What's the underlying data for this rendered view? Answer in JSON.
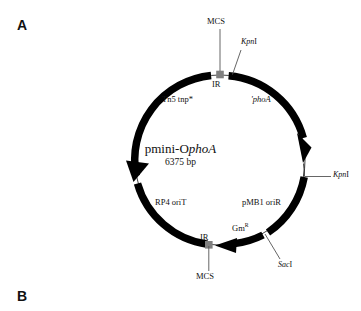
{
  "figure": {
    "panels": [
      {
        "id": "a",
        "label": "A"
      },
      {
        "id": "b",
        "label": "B"
      }
    ]
  },
  "plasmid_map": {
    "name_plain": "pmini-O",
    "name_italic": "phoA",
    "size": "6375 bp",
    "backbone_color": "#000000",
    "ir_box_color": "#808080",
    "leader_line_color": "#555555",
    "features": [
      {
        "name": "tn5-tnp",
        "label": "Tn5 tnp*",
        "style": "roman"
      },
      {
        "name": "phoa",
        "label": "'phoA",
        "style": "italic"
      },
      {
        "name": "pmb1-orir",
        "label": "pMB1 oriR",
        "style": "roman"
      },
      {
        "name": "rp4-orit",
        "label": "RP4 oriT",
        "style": "roman"
      },
      {
        "name": "gm-resistance",
        "label_base": "Gm",
        "label_sup": "R",
        "style": "roman"
      }
    ],
    "elements": [
      {
        "name": "ir-top",
        "label": "IR"
      },
      {
        "name": "ir-bottom",
        "label": "IR"
      },
      {
        "name": "mcs-top",
        "label": "MCS"
      },
      {
        "name": "mcs-bottom",
        "label": "MCS"
      }
    ],
    "restriction_sites": [
      {
        "name": "kpni-top",
        "italic": "Kpn",
        "roman": "I"
      },
      {
        "name": "kpni-right",
        "italic": "Kpn",
        "roman": "I"
      },
      {
        "name": "saci-bottom",
        "italic": "Sac",
        "roman": "I"
      }
    ]
  }
}
